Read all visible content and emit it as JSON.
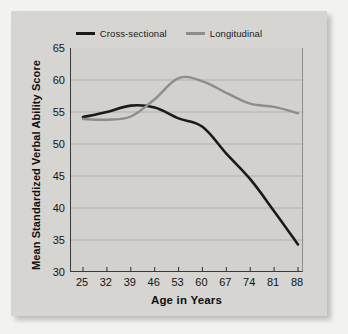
{
  "chart_data": {
    "type": "line",
    "title": "",
    "xlabel": "Age in Years",
    "ylabel": "Mean Standardized Verbal Ability Score",
    "x": [
      25,
      32,
      39,
      46,
      53,
      60,
      67,
      74,
      81,
      88
    ],
    "xticklabels": [
      "25",
      "32",
      "39",
      "46",
      "53",
      "60",
      "67",
      "74",
      "81",
      "88"
    ],
    "yticklabels": [
      "30",
      "35",
      "40",
      "45",
      "50",
      "55",
      "60",
      "65"
    ],
    "yticks": [
      30,
      35,
      40,
      45,
      50,
      55,
      60,
      65
    ],
    "xlim": [
      25,
      88
    ],
    "ylim": [
      30,
      65
    ],
    "grid": "horizontal",
    "legend_position": "top-center",
    "series": [
      {
        "name": "Cross-sectional",
        "color": "#1a1a1a",
        "values": [
          54.2,
          55.0,
          56.0,
          55.7,
          54.0,
          52.7,
          48.5,
          44.5,
          39.5,
          34.3
        ]
      },
      {
        "name": "Longitudinal",
        "color": "#8d8d8b",
        "values": [
          53.9,
          53.8,
          54.3,
          57.0,
          60.3,
          59.8,
          58.0,
          56.3,
          55.8,
          54.8
        ]
      }
    ]
  },
  "colors": {
    "page_background": "#f2f2f0",
    "panel_background": "#d6d5d2",
    "plot_background": "#d2d1ce",
    "axis": "#3a3a38",
    "gridline": "#a9a8a5",
    "cross_sectional": "#1a1a1a",
    "longitudinal": "#8d8d8b",
    "text": "#141414"
  }
}
